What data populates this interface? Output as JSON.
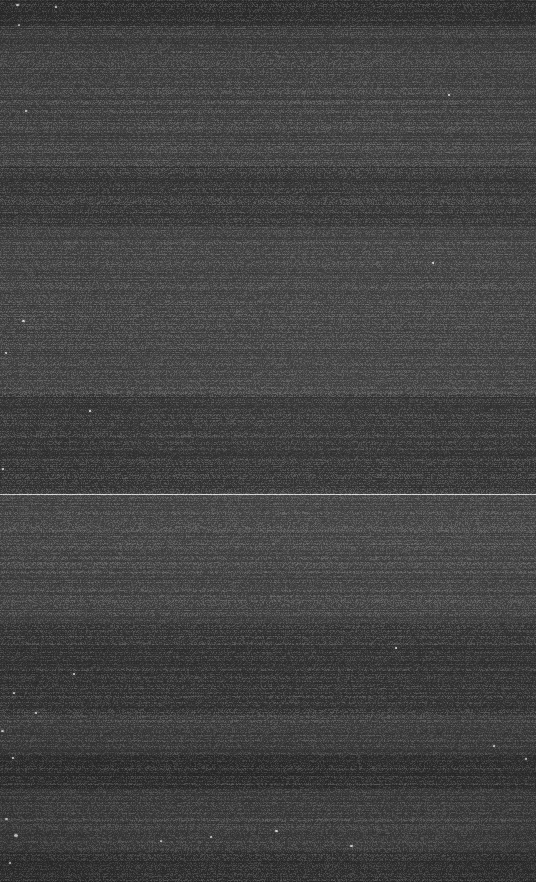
{
  "frame": {
    "width": 536,
    "height": 882,
    "description": "Very dark low-contrast photographic frame of a flat matte surface",
    "subject": "dark-gray-flat-surface",
    "has_text": false,
    "has_ui_chrome": false,
    "background_color": "#3b3b3b",
    "darkest_color": "#2e2e2e",
    "lightest_color": "#454545",
    "hairline_color": "#d6d6d6",
    "speck_color": "#e8e8e8"
  },
  "tonal_bands": [
    {
      "name": "top-edge-band",
      "top": 0,
      "height": 26,
      "shade": "dark"
    },
    {
      "name": "upper-field",
      "top": 26,
      "height": 140,
      "shade": "light"
    },
    {
      "name": "upper-mid-band",
      "top": 166,
      "height": 60,
      "shade": "dark"
    },
    {
      "name": "mid-field",
      "top": 226,
      "height": 168,
      "shade": "light"
    },
    {
      "name": "pre-hairline-band",
      "top": 394,
      "height": 100,
      "shade": "dark"
    },
    {
      "name": "post-hairline-field",
      "top": 495,
      "height": 128,
      "shade": "light"
    },
    {
      "name": "lower-mid-band",
      "top": 623,
      "height": 92,
      "shade": "dark"
    },
    {
      "name": "lower-field",
      "top": 715,
      "height": 40,
      "shade": "light"
    },
    {
      "name": "lower-dark-band",
      "top": 755,
      "height": 34,
      "shade": "dark"
    },
    {
      "name": "bottom-field",
      "top": 789,
      "height": 62,
      "shade": "light"
    },
    {
      "name": "bottom-edge-band",
      "top": 851,
      "height": 31,
      "shade": "dark"
    }
  ],
  "hairline": {
    "name": "horizontal-hairline",
    "y": 494,
    "thickness": 1
  },
  "specks": [
    {
      "x": 16,
      "y": 4,
      "size": 3
    },
    {
      "x": 55,
      "y": 6,
      "size": 2
    },
    {
      "x": 18,
      "y": 24,
      "size": 2
    },
    {
      "x": 25,
      "y": 110,
      "size": 2
    },
    {
      "x": 22,
      "y": 320,
      "size": 3
    },
    {
      "x": 5,
      "y": 352,
      "size": 2
    },
    {
      "x": 89,
      "y": 410,
      "size": 2
    },
    {
      "x": 2,
      "y": 468,
      "size": 2
    },
    {
      "x": 448,
      "y": 94,
      "size": 2
    },
    {
      "x": 432,
      "y": 262,
      "size": 2
    },
    {
      "x": 395,
      "y": 647,
      "size": 2
    },
    {
      "x": 73,
      "y": 673,
      "size": 2
    },
    {
      "x": 13,
      "y": 692,
      "size": 2
    },
    {
      "x": 35,
      "y": 712,
      "size": 2
    },
    {
      "x": 1,
      "y": 730,
      "size": 3
    },
    {
      "x": 12,
      "y": 757,
      "size": 2
    },
    {
      "x": 210,
      "y": 836,
      "size": 2
    },
    {
      "x": 275,
      "y": 830,
      "size": 3
    },
    {
      "x": 350,
      "y": 845,
      "size": 3
    },
    {
      "x": 160,
      "y": 840,
      "size": 2
    },
    {
      "x": 14,
      "y": 834,
      "size": 4
    },
    {
      "x": 5,
      "y": 818,
      "size": 3
    },
    {
      "x": 9,
      "y": 862,
      "size": 2
    },
    {
      "x": 493,
      "y": 745,
      "size": 2
    },
    {
      "x": 525,
      "y": 758,
      "size": 2
    }
  ]
}
